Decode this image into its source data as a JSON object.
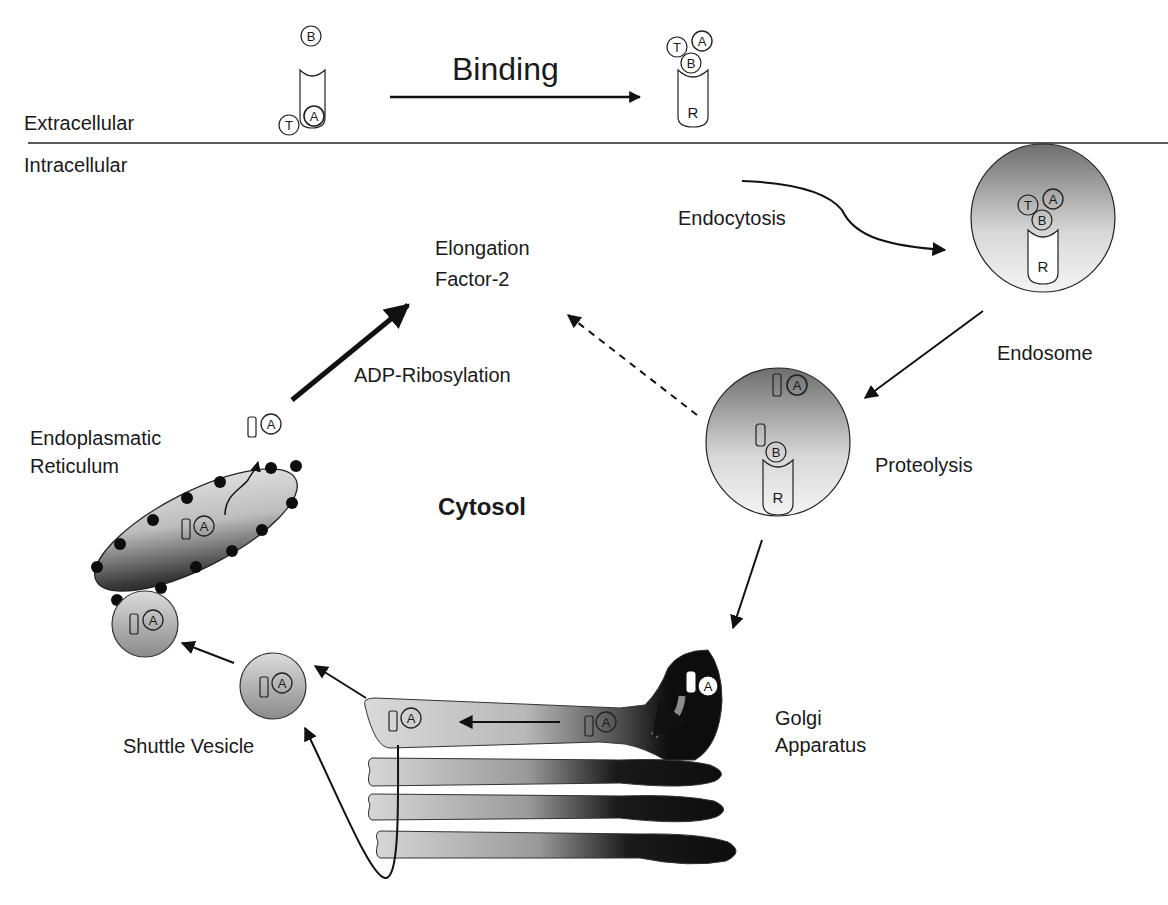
{
  "regions": {
    "extracellular": "Extracellular",
    "intracellular": "Intracellular",
    "cytosol": "Cytosol"
  },
  "steps": {
    "binding": "Binding",
    "endocytosis": "Endocytosis",
    "proteolysis": "Proteolysis",
    "adp_ribosylation": "ADP-Ribosylation"
  },
  "organelles": {
    "endosome": "Endosome",
    "golgi_line1": "Golgi",
    "golgi_line2": "Apparatus",
    "er_line1": "Endoplasmatic",
    "er_line2": "Reticulum",
    "shuttle_vesicle": "Shuttle Vesicle"
  },
  "target": {
    "line1": "Elongation",
    "line2": "Factor-2"
  },
  "molecules": {
    "toxin_T": "T",
    "toxin_A": "A",
    "toxin_B": "B",
    "receptor_R": "R"
  },
  "colors": {
    "stroke": "#1a1a1a",
    "gray_light": "#e6e6e6",
    "gray_mid": "#9a9a9a",
    "gray_dark": "#555555",
    "black": "#0d0d0d"
  }
}
